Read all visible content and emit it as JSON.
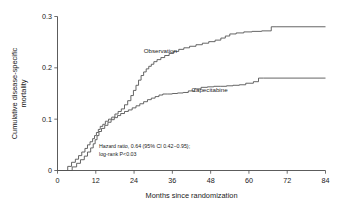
{
  "chart_data": {
    "type": "line",
    "title": "",
    "subtitle": "",
    "xlabel": "Months since randomization",
    "ylabel": "Cumulative disease-specific mortality",
    "xlim": [
      0,
      84
    ],
    "ylim": [
      0,
      0.3
    ],
    "grid": false,
    "legend_position": "inline-annotations",
    "xticks": [
      0,
      12,
      24,
      36,
      48,
      60,
      72,
      84
    ],
    "xticklabels": [
      "0",
      "12",
      "24",
      "36",
      "48",
      "60",
      "72",
      "84"
    ],
    "yticks": [
      0,
      0.1,
      0.2,
      0.3
    ],
    "yticklabels": [
      "0",
      "0.1",
      "0.2",
      "0.3"
    ],
    "step_shape": "post",
    "series": [
      {
        "name": "Observation",
        "label_x": 27,
        "label_y": 0.228,
        "x": [
          0,
          2,
          3.2,
          4.4,
          5.6,
          6.6,
          7.6,
          8.6,
          9.4,
          10.2,
          11.0,
          11.6,
          12.2,
          12.8,
          13.4,
          14.2,
          15.0,
          16.0,
          17.0,
          18.0,
          19.0,
          20.0,
          21.0,
          22.0,
          23.0,
          23.8,
          24.6,
          25.4,
          26.2,
          27.0,
          27.8,
          28.6,
          29.4,
          30.2,
          31.2,
          32.4,
          33.6,
          35.0,
          36.4,
          38.0,
          39.6,
          41.4,
          43.4,
          45.4,
          47.4,
          49.4,
          51.2,
          52.6,
          54.0,
          56.0,
          58.4,
          61.0,
          64.0,
          67.0,
          68.5,
          84
        ],
        "y": [
          0.0,
          0.0,
          0.008,
          0.016,
          0.022,
          0.029,
          0.036,
          0.043,
          0.05,
          0.056,
          0.062,
          0.068,
          0.074,
          0.08,
          0.086,
          0.09,
          0.096,
          0.1,
          0.104,
          0.11,
          0.115,
          0.12,
          0.128,
          0.136,
          0.146,
          0.156,
          0.166,
          0.176,
          0.185,
          0.192,
          0.198,
          0.203,
          0.207,
          0.212,
          0.216,
          0.22,
          0.224,
          0.228,
          0.232,
          0.236,
          0.239,
          0.242,
          0.245,
          0.248,
          0.251,
          0.254,
          0.258,
          0.262,
          0.266,
          0.268,
          0.27,
          0.271,
          0.272,
          0.28,
          0.28,
          0.28
        ]
      },
      {
        "name": "Capecitabine",
        "label_x": 42,
        "label_y": 0.152,
        "x": [
          0,
          3.0,
          4.6,
          6.0,
          7.2,
          8.4,
          9.4,
          10.4,
          11.2,
          11.8,
          12.4,
          13.0,
          13.8,
          14.8,
          15.8,
          16.8,
          17.8,
          18.8,
          19.8,
          21.0,
          22.2,
          23.4,
          24.6,
          25.8,
          27.0,
          28.2,
          29.4,
          30.6,
          31.8,
          33.0,
          34.4,
          36.0,
          37.6,
          39.4,
          41.0,
          43.0,
          45.0,
          47.0,
          49.0,
          51.0,
          53.0,
          55.0,
          57.0,
          59.0,
          61.4,
          63.0,
          64.6,
          84
        ],
        "y": [
          0.0,
          0.0,
          0.007,
          0.014,
          0.021,
          0.028,
          0.036,
          0.044,
          0.052,
          0.06,
          0.068,
          0.076,
          0.082,
          0.088,
          0.094,
          0.099,
          0.103,
          0.107,
          0.111,
          0.115,
          0.118,
          0.122,
          0.126,
          0.13,
          0.134,
          0.138,
          0.141,
          0.144,
          0.147,
          0.149,
          0.149,
          0.15,
          0.151,
          0.152,
          0.155,
          0.159,
          0.162,
          0.163,
          0.164,
          0.164,
          0.165,
          0.166,
          0.167,
          0.17,
          0.173,
          0.18,
          0.18,
          0.18
        ]
      }
    ],
    "annotations": [
      {
        "text": "Hazard ratio, 0.64 (95% CI 0.42−0.95);",
        "x": 13,
        "y": 0.043
      },
      {
        "text": "log-rank P<0.03",
        "x": 13,
        "y": 0.028
      }
    ]
  },
  "colors": {
    "curve": "#555555",
    "axis": "#4a4a4a",
    "text": "#1a1a1a",
    "background": "#ffffff"
  }
}
